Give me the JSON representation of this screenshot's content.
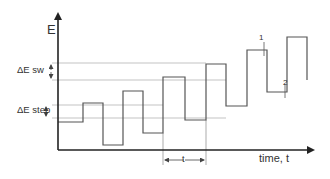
{
  "diagram": {
    "type": "staircase square-wave potential waveform",
    "y_axis": {
      "label": "E"
    },
    "x_axis": {
      "label": "time, t"
    },
    "annotations": {
      "delta_e_sw": "ΔE sw",
      "delta_e_step": "ΔE step",
      "period": "t",
      "point_1": "1",
      "point_2": "2"
    },
    "colors": {
      "axis": "#222222",
      "waveform": "#555555",
      "gridline": "#aaaaaa",
      "text": "#333333"
    },
    "waveform_points": [
      [
        58,
        122
      ],
      [
        83,
        122
      ],
      [
        83,
        103
      ],
      [
        103,
        103
      ],
      [
        103,
        145
      ],
      [
        123,
        145
      ],
      [
        123,
        91
      ],
      [
        143,
        91
      ],
      [
        143,
        133
      ],
      [
        163,
        133
      ],
      [
        163,
        77
      ],
      [
        185,
        77
      ],
      [
        185,
        120
      ],
      [
        206,
        120
      ],
      [
        206,
        64
      ],
      [
        226,
        64
      ],
      [
        226,
        106
      ],
      [
        247,
        106
      ],
      [
        247,
        50
      ],
      [
        267,
        50
      ],
      [
        267,
        92
      ],
      [
        287,
        92
      ],
      [
        287,
        37
      ],
      [
        307,
        37
      ],
      [
        307,
        80
      ]
    ],
    "gridlines_y": [
      63,
      80,
      105,
      118
    ]
  }
}
